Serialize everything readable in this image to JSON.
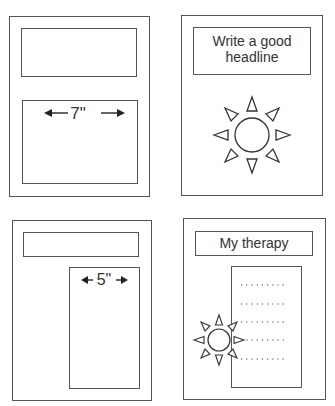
{
  "panels": [
    {
      "id": "layout-1",
      "headline_text": "",
      "measure_label": "7\"",
      "description": "Headline box above a wide 7-inch text block"
    },
    {
      "id": "layout-2",
      "headline_text": "Write a good headline",
      "illustration": "sun-icon"
    },
    {
      "id": "layout-3",
      "headline_text": "",
      "measure_label": "5\"",
      "description": "Headline box above a narrow 5-inch column on the right"
    },
    {
      "id": "layout-4",
      "headline_text": "My therapy",
      "illustration": "sun-icon",
      "dotted_lines": 5
    }
  ],
  "colors": {
    "stroke": "#555555",
    "text": "#333333",
    "background": "#ffffff"
  }
}
